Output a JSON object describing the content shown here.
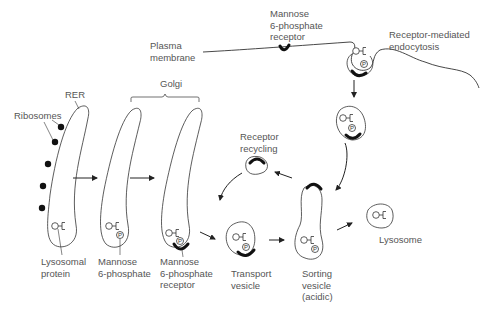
{
  "diagram": {
    "labels": {
      "plasma_membrane": "Plasma\nmembrane",
      "m6p_receptor_top": "Mannose\n6-phosphate\nreceptor",
      "receptor_mediated_endocytosis": "Receptor-mediated\nendocytosis",
      "golgi": "Golgi",
      "rer": "RER",
      "ribosomes": "Ribosomes",
      "receptor_recycling": "Receptor\nrecycling",
      "lysosomal_protein": "Lysosomal\nprotein",
      "mannose_6_phosphate": "Mannose\n6-phosphate",
      "m6p_receptor_bottom": "Mannose\n6-phosphate\nreceptor",
      "transport_vesicle": "Transport\nvesicle",
      "sorting_vesicle": "Sorting\nvesicle\n(acidic)",
      "lysosome": "Lysosome"
    },
    "phosphate_symbol": "P",
    "colors": {
      "line": "#333333",
      "receptor": "#111111",
      "text": "#555555"
    }
  }
}
